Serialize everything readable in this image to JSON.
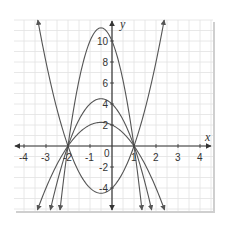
{
  "chart_data": {
    "type": "line",
    "title": "",
    "xlabel": "x",
    "ylabel": "y",
    "xlim": [
      -4.45,
      4.6
    ],
    "ylim": [
      -6.2,
      12
    ],
    "grid": true,
    "grid_spacing": {
      "x": 0.5,
      "y": 1
    },
    "x_ticks": [
      -4,
      -3,
      -2,
      -1,
      1,
      2,
      3,
      4
    ],
    "y_ticks": [
      -4,
      -2,
      2,
      4,
      6,
      8,
      10
    ],
    "origin_label": "0",
    "legend": null,
    "series": [
      {
        "name": "y = 2(x+2)(x-1)",
        "a": 2,
        "roots": [
          -2,
          1
        ],
        "y_intercept": -4,
        "vertex": [
          -0.5,
          -4.5
        ],
        "opens": "up"
      },
      {
        "name": "y = -(x+2)(x-1)",
        "a": -1,
        "roots": [
          -2,
          1
        ],
        "y_intercept": 2,
        "vertex": [
          -0.5,
          2.25
        ],
        "opens": "down"
      },
      {
        "name": "y = -2(x+2)(x-1)",
        "a": -2,
        "roots": [
          -2,
          1
        ],
        "y_intercept": 4,
        "vertex": [
          -0.5,
          4.5
        ],
        "opens": "down"
      },
      {
        "name": "y = -5(x+2)(x-1)",
        "a": -5,
        "roots": [
          -2,
          1
        ],
        "y_intercept": 10,
        "vertex": [
          -0.5,
          11.25
        ],
        "opens": "down"
      }
    ],
    "annotations": [
      "All parabolas pass through (-2, 0) and (1, 0)"
    ]
  },
  "colors": {
    "curve": "#555555",
    "axis": "#333333",
    "grid": "#e2e2e2",
    "background": "#ffffff",
    "shadow": "#cfcfcf"
  }
}
